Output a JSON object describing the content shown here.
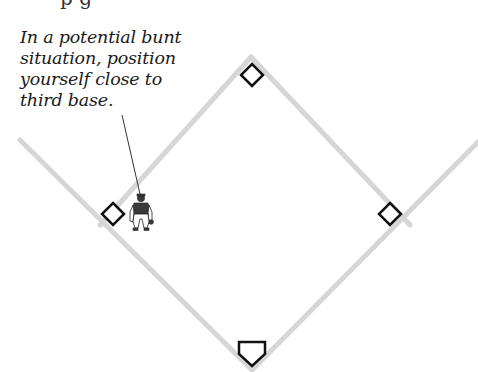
{
  "caption": {
    "lines": [
      "In a potential bunt",
      "situation, position",
      "yourself close to",
      "third base."
    ]
  },
  "top_cut_text": "p g",
  "field": {
    "line_color": "#d6d6d6",
    "base_stroke": "#111111",
    "base_fill": "#ffffff",
    "bases": [
      "second-base",
      "third-base",
      "first-base",
      "home-plate"
    ]
  },
  "player": {
    "position": "near third base",
    "colors": {
      "jersey": "#3a3a3a",
      "pants": "#ffffff",
      "outline": "#222222"
    }
  }
}
